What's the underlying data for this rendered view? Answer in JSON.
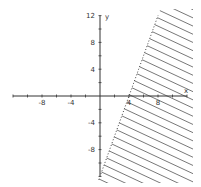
{
  "chart_data": {
    "type": "line",
    "title": "",
    "xlabel": "x",
    "ylabel": "y",
    "xlim": [
      -12,
      12
    ],
    "ylim": [
      -12,
      12
    ],
    "x_ticks": [
      -8,
      -4,
      4,
      8
    ],
    "y_ticks": [
      12,
      8,
      4,
      -4,
      -8
    ],
    "x_minor_step": 2,
    "y_minor_step": 2,
    "grid": false,
    "boundary": {
      "equation": "y = 3x - 12",
      "slope": 3,
      "intercept": -12,
      "style": "dotted"
    },
    "shaded_region": {
      "inequality": "y < 3x - 12",
      "side": "right-below",
      "style": "hatched"
    },
    "colors": {
      "axis": "#333333",
      "boundary": "#444444",
      "hatch": "#555555"
    }
  }
}
